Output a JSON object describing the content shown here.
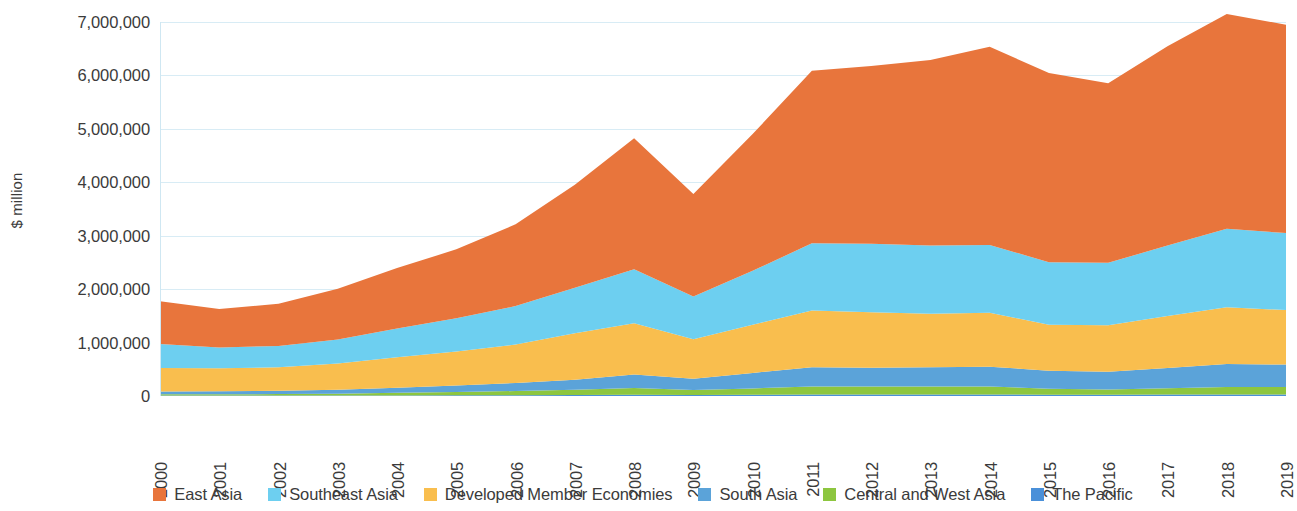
{
  "chart_data": {
    "type": "area",
    "stacked": true,
    "title": "",
    "subtitle": "",
    "xlabel": "",
    "ylabel": "$ million",
    "x": [
      2000,
      2001,
      2002,
      2003,
      2004,
      2005,
      2006,
      2007,
      2008,
      2009,
      2010,
      2011,
      2012,
      2013,
      2014,
      2015,
      2016,
      2017,
      2018,
      2019
    ],
    "xtick_labels": [
      "2000",
      "2001",
      "2002",
      "2003",
      "2004",
      "2005",
      "2006",
      "2007",
      "2008",
      "2009",
      "2010",
      "2011",
      "2012",
      "2013",
      "2014",
      "2015",
      "2016",
      "2017",
      "2018",
      "2019"
    ],
    "ytick_labels": [
      "0",
      "1,000,000",
      "2,000,000",
      "3,000,000",
      "4,000,000",
      "5,000,000",
      "6,000,000",
      "7,000,000"
    ],
    "ytick_values": [
      0,
      1000000,
      2000000,
      3000000,
      4000000,
      5000000,
      6000000,
      7000000
    ],
    "ylim": [
      0,
      7000000
    ],
    "grid": true,
    "legend_position": "bottom",
    "stack_order_bottom_to_top": [
      "The Pacific",
      "Central and West Asia",
      "South Asia",
      "Developed Member Economies",
      "Southeast Asia",
      "East Asia"
    ],
    "series": [
      {
        "name": "East Asia",
        "color": "#E8753C",
        "values": [
          800000,
          720000,
          790000,
          950000,
          1130000,
          1290000,
          1530000,
          1930000,
          2450000,
          1920000,
          2560000,
          3230000,
          3330000,
          3470000,
          3710000,
          3540000,
          3360000,
          3730000,
          4020000,
          3900000
        ]
      },
      {
        "name": "Southeast Asia",
        "color": "#6DCFF0",
        "values": [
          450000,
          390000,
          400000,
          450000,
          540000,
          620000,
          720000,
          850000,
          1010000,
          800000,
          1010000,
          1260000,
          1280000,
          1280000,
          1270000,
          1170000,
          1170000,
          1320000,
          1470000,
          1440000
        ]
      },
      {
        "name": "Developed Member Economies",
        "color": "#F9BE4E",
        "values": [
          440000,
          430000,
          440000,
          490000,
          570000,
          640000,
          720000,
          870000,
          960000,
          740000,
          900000,
          1060000,
          1040000,
          1000000,
          1010000,
          860000,
          870000,
          970000,
          1060000,
          1020000
        ]
      },
      {
        "name": "South Asia",
        "color": "#5BA3D9",
        "values": [
          50000,
          55000,
          60000,
          75000,
          95000,
          120000,
          150000,
          190000,
          250000,
          210000,
          290000,
          360000,
          350000,
          360000,
          370000,
          340000,
          330000,
          380000,
          430000,
          420000
        ]
      },
      {
        "name": "Central and West Asia",
        "color": "#8DC63F",
        "values": [
          25000,
          25000,
          28000,
          35000,
          48000,
          62000,
          78000,
          98000,
          130000,
          95000,
          120000,
          150000,
          150000,
          150000,
          150000,
          110000,
          100000,
          120000,
          140000,
          140000
        ]
      },
      {
        "name": "The Pacific",
        "color": "#4A90D9",
        "values": [
          8000,
          8000,
          8000,
          9000,
          11000,
          13000,
          15000,
          18000,
          22000,
          18000,
          22000,
          28000,
          28000,
          28000,
          28000,
          24000,
          23000,
          26000,
          29000,
          29000
        ]
      }
    ]
  },
  "legend": {
    "items": [
      {
        "label": "East Asia",
        "color": "#E8753C"
      },
      {
        "label": "Southeast Asia",
        "color": "#6DCFF0"
      },
      {
        "label": "Developed Member Economies",
        "color": "#F9BE4E"
      },
      {
        "label": "South Asia",
        "color": "#5BA3D9"
      },
      {
        "label": "Central and West Asia",
        "color": "#8DC63F"
      },
      {
        "label": "The Pacific",
        "color": "#4A90D9"
      }
    ]
  },
  "axes": {
    "y_title": "$ million"
  }
}
